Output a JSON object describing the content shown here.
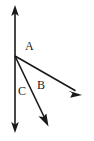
{
  "figure": {
    "type": "vector-diagram",
    "background_color": "#ffffff",
    "stroke_color": "#1a1a1a",
    "canvas": {
      "width": 94,
      "height": 141
    },
    "origin": {
      "x": 15,
      "y": 56
    }
  },
  "labels": [
    {
      "id": "A",
      "text": "A",
      "x": 25,
      "y": 40
    },
    {
      "id": "B",
      "text": "B",
      "x": 37,
      "y": 79
    },
    {
      "id": "C",
      "text": "C",
      "x": 18,
      "y": 85
    }
  ],
  "vectors": [
    {
      "name": "vertical-axis",
      "label": "C",
      "double_headed": true,
      "from": {
        "x": 15,
        "y": 6
      },
      "to": {
        "x": 15,
        "y": 132
      },
      "stroke_width": 1.6
    },
    {
      "name": "vector-b",
      "label": "B",
      "double_headed": false,
      "from": {
        "x": 15,
        "y": 56
      },
      "to": {
        "x": 81,
        "y": 94
      },
      "stroke_width": 1.6
    },
    {
      "name": "vector-steep",
      "label": "",
      "double_headed": false,
      "from": {
        "x": 15,
        "y": 56
      },
      "to": {
        "x": 48,
        "y": 125
      },
      "stroke_width": 1.6
    }
  ]
}
